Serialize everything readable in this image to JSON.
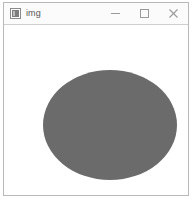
{
  "window": {
    "title": "img",
    "icon": "image-icon",
    "frame_border_color": "#b9b9b9",
    "titlebar_bg": "#fbfbfb",
    "title_color": "#555555"
  },
  "window_controls": {
    "minimize": {
      "label": "—",
      "name": "minimize-button",
      "glyph": "minimize-icon"
    },
    "maximize": {
      "label": "□",
      "name": "maximize-button",
      "glyph": "maximize-icon"
    },
    "close": {
      "label": "✕",
      "name": "close-button",
      "glyph": "close-icon"
    }
  },
  "canvas": {
    "background": "#ffffff",
    "shape": {
      "type": "ellipse",
      "fill": "#6b6b6b",
      "center_x": 110,
      "center_y": 125,
      "radius_x": 67,
      "radius_y": 55
    }
  }
}
